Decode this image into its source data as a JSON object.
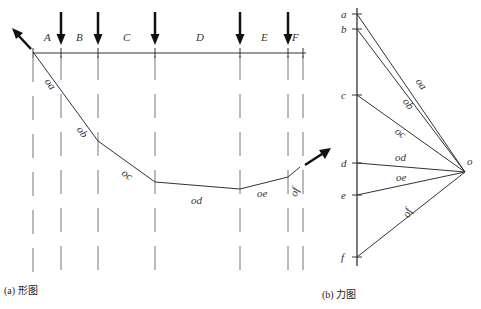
{
  "shape_diagram": {
    "caption": "(a) 形图",
    "segment_labels": [
      "A",
      "B",
      "C",
      "D",
      "E",
      "F"
    ],
    "string_labels": [
      "oa",
      "ob",
      "oc",
      "od",
      "oe",
      "of"
    ]
  },
  "force_diagram": {
    "caption": "(b) 力图",
    "point_labels": [
      "a",
      "b",
      "c",
      "d",
      "e",
      "f"
    ],
    "pole_label": "o",
    "ray_labels": [
      "oa",
      "ob",
      "oc",
      "od",
      "oe",
      "of"
    ]
  },
  "colors": {
    "line": "#333333",
    "arrow": "#111111",
    "dash": "#777777"
  }
}
